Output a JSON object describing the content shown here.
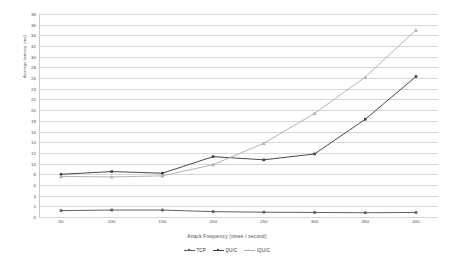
{
  "chart_data": {
    "type": "line",
    "title": "",
    "xlabel": "Attack Frequency (times / second)",
    "ylabel": "Average latency (ms)",
    "x": [
      50,
      100,
      150,
      200,
      250,
      300,
      350,
      400
    ],
    "xticklabels": [
      "50",
      "100",
      "150",
      "200",
      "250",
      "300",
      "350",
      "400"
    ],
    "yticklabels": [
      "0",
      "2",
      "4",
      "6",
      "8",
      "10",
      "12",
      "14",
      "16",
      "18",
      "20",
      "22",
      "24",
      "26",
      "28",
      "30",
      "32",
      "34",
      "36",
      "38"
    ],
    "ylim": [
      0,
      38
    ],
    "ytick_step": 2,
    "grid": true,
    "legend_position": "bottom",
    "series": [
      {
        "name": "TCP",
        "color": "#595959",
        "marker": "square",
        "values": [
          1.2,
          1.3,
          1.3,
          1.0,
          0.9,
          0.85,
          0.8,
          0.85
        ]
      },
      {
        "name": "QUIC",
        "color": "#3f3f3f",
        "marker": "square",
        "values": [
          8.0,
          8.5,
          8.2,
          11.3,
          10.7,
          11.8,
          18.3,
          26.3
        ]
      },
      {
        "name": "IQUIC",
        "color": "#b0b0b0",
        "marker": "triangle",
        "values": [
          7.6,
          7.5,
          7.7,
          9.8,
          13.8,
          19.4,
          26.2,
          35.0
        ]
      }
    ]
  }
}
